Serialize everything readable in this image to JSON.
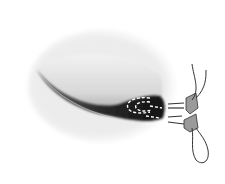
{
  "figure": {
    "colors": {
      "background": "#ffffff",
      "outer_rim": "#e8e8e8",
      "inner_surface": "#dcdcdc",
      "cavity_dark": "#1e1e1e",
      "suture": "#444444",
      "pledget": "#8a8a8a"
    }
  }
}
